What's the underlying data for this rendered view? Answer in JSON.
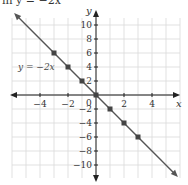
{
  "header": {
    "text": "in y = −2x"
  },
  "chart_data": {
    "type": "line",
    "title": "",
    "equation_label": "y = −2x",
    "xlabel": "x",
    "ylabel": "y",
    "xlim": [
      -6,
      6
    ],
    "ylim": [
      -12,
      12
    ],
    "x_ticks": [
      -4,
      -2,
      2,
      4
    ],
    "x_tick_labels": [
      "−4",
      "−2",
      "2",
      "4"
    ],
    "y_ticks": [
      10,
      8,
      6,
      4,
      2,
      -2,
      -4,
      -6,
      -8,
      -10
    ],
    "y_tick_labels": [
      "10",
      "8",
      "6",
      "4",
      "2",
      "−2",
      "−4",
      "−6",
      "−8",
      "−10"
    ],
    "origin_label": "0",
    "grid": true,
    "series": [
      {
        "name": "y = −2x",
        "slope": -2,
        "intercept": 0,
        "points": [
          {
            "x": -3,
            "y": 6
          },
          {
            "x": -2,
            "y": 4
          },
          {
            "x": -1,
            "y": 2
          },
          {
            "x": 0,
            "y": 0
          },
          {
            "x": 1,
            "y": -2
          },
          {
            "x": 2,
            "y": -4
          },
          {
            "x": 3,
            "y": -6
          }
        ]
      }
    ],
    "colors": {
      "line": "#555555",
      "grid": "#d9d9d9",
      "axis": "#222222",
      "point": "#444444"
    }
  }
}
